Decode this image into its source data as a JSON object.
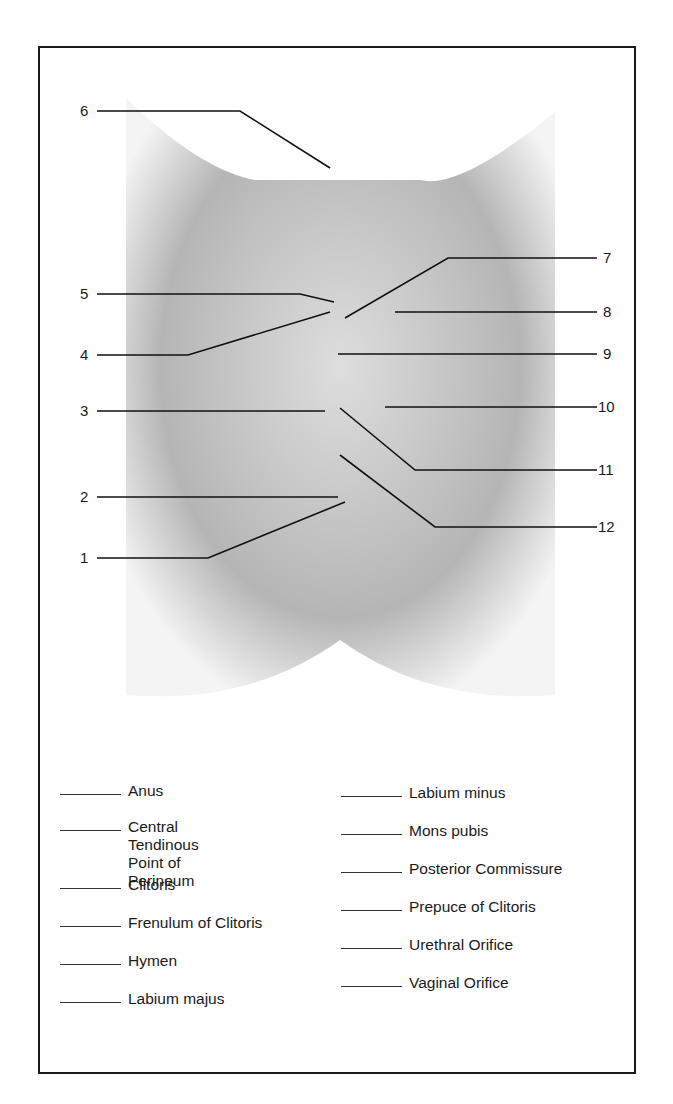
{
  "diagram": {
    "type": "anatomy-labeling-worksheet",
    "callouts": [
      {
        "number": "1",
        "side": "left"
      },
      {
        "number": "2",
        "side": "left"
      },
      {
        "number": "3",
        "side": "left"
      },
      {
        "number": "4",
        "side": "left"
      },
      {
        "number": "5",
        "side": "left"
      },
      {
        "number": "6",
        "side": "left"
      },
      {
        "number": "7",
        "side": "right"
      },
      {
        "number": "8",
        "side": "right"
      },
      {
        "number": "9",
        "side": "right"
      },
      {
        "number": "10",
        "side": "right"
      },
      {
        "number": "11",
        "side": "right"
      },
      {
        "number": "12",
        "side": "right"
      }
    ]
  },
  "word_bank": {
    "left_column": [
      "Anus",
      "Central Tendinous\nPoint of Perineum",
      "Clitoris",
      "Frenulum of Clitoris",
      "Hymen",
      "Labium majus"
    ],
    "right_column": [
      "Labium minus",
      "Mons pubis",
      "Posterior Commissure",
      "Prepuce of Clitoris",
      "Urethral Orifice",
      "Vaginal Orifice"
    ]
  }
}
